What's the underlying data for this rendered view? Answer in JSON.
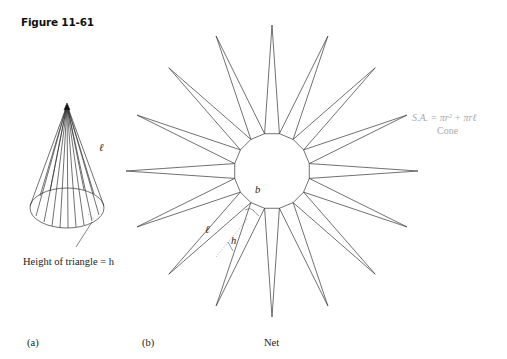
{
  "figure": {
    "title": "Figure 11-61"
  },
  "panel_a": {
    "label": "(a)",
    "slant_label": "ℓ",
    "triangle_height_caption": "Height of triangle = h"
  },
  "panel_b": {
    "label": "(b)",
    "caption": "Net",
    "base_label": "b",
    "slant_label": "ℓ",
    "height_label": "h",
    "num_triangles": 16
  },
  "formula": {
    "text": "S.A. = πr² + πrℓ",
    "caption": "Cone"
  },
  "colors": {
    "line": "#333333",
    "formula_text": "#aaaaaa",
    "dashed": "#999999"
  }
}
